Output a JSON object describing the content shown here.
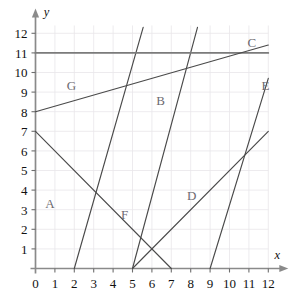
{
  "chart_data": {
    "type": "line",
    "title": "",
    "xlabel": "x",
    "ylabel": "y",
    "xlim": [
      0,
      12
    ],
    "ylim": [
      0,
      12.4
    ],
    "grid": true,
    "legend": "inline-labels",
    "x_ticks": [
      "0",
      "1",
      "2",
      "3",
      "4",
      "5",
      "6",
      "7",
      "8",
      "9",
      "10",
      "11",
      "12"
    ],
    "y_ticks": [
      "1",
      "2",
      "3",
      "4",
      "5",
      "6",
      "7",
      "8",
      "9",
      "10",
      "11",
      "12"
    ],
    "series": [
      {
        "name": "A",
        "label": "A",
        "label_x": 0.75,
        "label_y": 3.3,
        "points": [
          [
            2,
            0
          ],
          [
            5.55,
            12.3
          ]
        ],
        "slope": 3.46,
        "intercept": -6.93
      },
      {
        "name": "B",
        "label": "B",
        "label_x": 6.45,
        "label_y": 8.55,
        "points": [
          [
            5,
            0
          ],
          [
            8.35,
            12.3
          ]
        ],
        "slope": 3.67,
        "intercept": -18.36
      },
      {
        "name": "C",
        "label": "C",
        "label_x": 11.15,
        "label_y": 11.55,
        "points": [
          [
            0,
            11
          ],
          [
            12,
            11
          ]
        ],
        "slope": 0,
        "intercept": 11
      },
      {
        "name": "D",
        "label": "D",
        "label_x": 8.05,
        "label_y": 3.75,
        "points": [
          [
            5,
            0
          ],
          [
            12,
            7
          ]
        ],
        "slope": 1,
        "intercept": -5
      },
      {
        "name": "E",
        "label": "E",
        "label_x": 11.85,
        "label_y": 9.35,
        "points": [
          [
            9,
            0
          ],
          [
            12,
            9.7
          ]
        ],
        "slope": 3.23,
        "intercept": -29.1
      },
      {
        "name": "F",
        "label": "F",
        "label_x": 4.6,
        "label_y": 2.75,
        "points": [
          [
            0,
            7
          ],
          [
            7,
            0
          ]
        ],
        "slope": -1,
        "intercept": 7
      },
      {
        "name": "G",
        "label": "G",
        "label_x": 1.85,
        "label_y": 9.35,
        "points": [
          [
            0,
            8
          ],
          [
            12,
            11.4
          ]
        ],
        "slope": 0.283,
        "intercept": 8
      }
    ]
  },
  "axes": {
    "x_axis_label": "x",
    "y_axis_label": "y"
  },
  "colors": {
    "background": "#ffffff",
    "grid": "#e8e6ea",
    "axis": "#8a8a8a",
    "line": "#4a4a4a",
    "line_c": "#7b7b7b",
    "label_text": "#6d6a70",
    "tick_text": "#111111"
  }
}
